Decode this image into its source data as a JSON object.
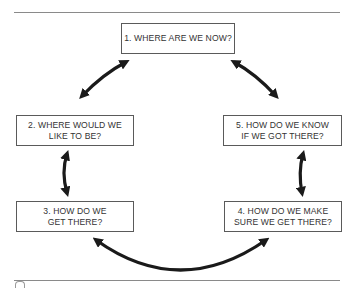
{
  "diagram": {
    "type": "cycle",
    "steps": [
      {
        "id": "b1",
        "label": "1. WHERE ARE WE NOW?"
      },
      {
        "id": "b2",
        "label": "2. WHERE WOULD WE\nLIKE TO BE?"
      },
      {
        "id": "b3",
        "label": "3. HOW DO WE\nGET THERE?"
      },
      {
        "id": "b4",
        "label": "4. HOW DO WE MAKE\nSURE WE GET THERE?"
      },
      {
        "id": "b5",
        "label": "5. HOW DO WE KNOW\nIF WE GOT THERE?"
      }
    ],
    "connections": [
      {
        "from": "1",
        "to": "2",
        "style": "double-headed-arrow"
      },
      {
        "from": "2",
        "to": "3",
        "style": "double-headed-arrow"
      },
      {
        "from": "3",
        "to": "4",
        "style": "double-headed-arrow"
      },
      {
        "from": "4",
        "to": "5",
        "style": "double-headed-arrow"
      },
      {
        "from": "5",
        "to": "1",
        "style": "double-headed-arrow"
      }
    ],
    "colors": {
      "line": "#1a1a1a",
      "box_border": "#5a5a5a",
      "text": "#333333"
    }
  }
}
